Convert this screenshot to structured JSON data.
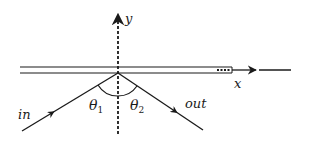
{
  "diagram": {
    "type": "waveguide-coupling-schematic",
    "axes": {
      "y_label": "y",
      "x_label": "x"
    },
    "rays": {
      "incident_label": "in",
      "outgoing_label": "out"
    },
    "angles": {
      "theta1": {
        "symbol": "θ",
        "subscript": "1"
      },
      "theta2": {
        "symbol": "θ",
        "subscript": "2"
      }
    },
    "colors": {
      "stroke": "#1a1a1a",
      "background": "#ffffff"
    }
  }
}
